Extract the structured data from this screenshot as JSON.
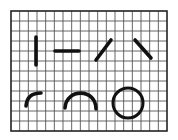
{
  "diagram": {
    "title": "",
    "background": "#ffffff",
    "ink_color": "#111111",
    "grid": {
      "x": 11,
      "y": 11,
      "width": 156,
      "height": 120,
      "cols": 18,
      "rows": 12,
      "line_color": "#555555",
      "border_color": "#222222"
    },
    "shapes": [
      {
        "name": "vertical-line-stroke",
        "type": "line",
        "x1": 36,
        "y1": 37,
        "x2": 36,
        "y2": 65
      },
      {
        "name": "horizontal-line-stroke",
        "type": "line",
        "x1": 55,
        "y1": 51,
        "x2": 79,
        "y2": 51
      },
      {
        "name": "forward-diagonal-stroke",
        "type": "line",
        "x1": 96,
        "y1": 60,
        "x2": 111,
        "y2": 40
      },
      {
        "name": "back-diagonal-stroke",
        "type": "line",
        "x1": 135,
        "y1": 40,
        "x2": 151,
        "y2": 58
      },
      {
        "name": "quarter-arc-stroke",
        "type": "path",
        "d": "M26 106 Q27 93 41 93"
      },
      {
        "name": "arch-stroke",
        "type": "path",
        "d": "M65 108 C66 88 96 88 96 109"
      },
      {
        "name": "circle-stroke",
        "type": "circle",
        "cx": 128,
        "cy": 103,
        "r": 15
      }
    ]
  }
}
